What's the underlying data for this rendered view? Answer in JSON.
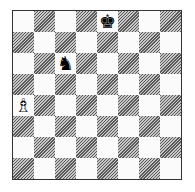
{
  "board": {
    "orientation": "white-bottom",
    "files": [
      "a",
      "b",
      "c",
      "d",
      "e",
      "f",
      "g",
      "h"
    ],
    "ranks": [
      8,
      7,
      6,
      5,
      4,
      3,
      2,
      1
    ],
    "light_color": "#fbfbfb",
    "dark_color": "#8c8c8c",
    "pieces": [
      {
        "square": "e8",
        "type": "king",
        "color": "black",
        "glyph": "♚"
      },
      {
        "square": "c6",
        "type": "knight",
        "color": "black",
        "glyph": "♞"
      },
      {
        "square": "a4",
        "type": "bishop",
        "color": "white",
        "glyph": "♗"
      }
    ]
  }
}
